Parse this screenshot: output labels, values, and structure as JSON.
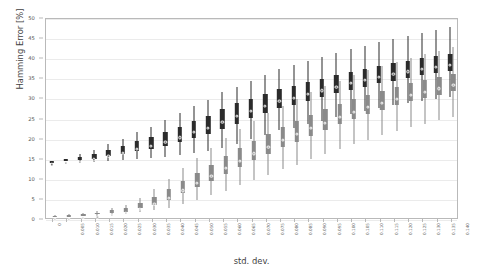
{
  "chart_data": {
    "type": "box",
    "title": "",
    "xlabel": "std. dev.",
    "ylabel": "Hamming Error [%]",
    "ylim": [
      0,
      50
    ],
    "yticks": [
      0,
      5,
      10,
      15,
      20,
      25,
      30,
      35,
      40,
      45,
      50
    ],
    "grid": true,
    "legend": "none",
    "categories": [
      "0",
      "0.005",
      "0.010",
      "0.015",
      "0.020",
      "0.025",
      "0.030",
      "0.035",
      "0.040",
      "0.045",
      "0.050",
      "0.055",
      "0.060",
      "0.065",
      "0.070",
      "0.075",
      "0.080",
      "0.085",
      "0.090",
      "0.095",
      "0.100",
      "0.105",
      "0.110",
      "0.115",
      "0.120",
      "0.125",
      "0.130",
      "0.135",
      "0.140"
    ],
    "series": [
      {
        "name": "upper",
        "color": "#2b2b2b",
        "boxes": [
          {
            "low": 14.0,
            "q1": 14.0,
            "median": 14.1,
            "q3": 14.2,
            "high": 14.3
          },
          {
            "low": 14.1,
            "q1": 14.2,
            "median": 14.4,
            "q3": 14.6,
            "high": 14.8
          },
          {
            "low": 13.8,
            "q1": 14.4,
            "median": 14.8,
            "q3": 15.2,
            "high": 15.9
          },
          {
            "low": 14.0,
            "q1": 14.8,
            "median": 15.3,
            "q3": 15.9,
            "high": 16.8
          },
          {
            "low": 14.2,
            "q1": 15.4,
            "median": 16.2,
            "q3": 17.0,
            "high": 18.3
          },
          {
            "low": 14.4,
            "q1": 16.0,
            "median": 17.0,
            "q3": 18.0,
            "high": 19.6
          },
          {
            "low": 14.6,
            "q1": 16.6,
            "median": 17.9,
            "q3": 19.1,
            "high": 21.3
          },
          {
            "low": 14.9,
            "q1": 17.2,
            "median": 18.7,
            "q3": 20.1,
            "high": 22.6
          },
          {
            "low": 15.1,
            "q1": 17.9,
            "median": 19.6,
            "q3": 21.3,
            "high": 24.3
          },
          {
            "low": 15.6,
            "q1": 18.9,
            "median": 20.8,
            "q3": 22.7,
            "high": 26.1
          },
          {
            "low": 16.2,
            "q1": 19.9,
            "median": 22.1,
            "q3": 24.2,
            "high": 27.9
          },
          {
            "low": 16.6,
            "q1": 20.9,
            "median": 23.2,
            "q3": 25.4,
            "high": 29.3
          },
          {
            "low": 17.4,
            "q1": 22.2,
            "median": 24.7,
            "q3": 27.0,
            "high": 31.4
          },
          {
            "low": 18.4,
            "q1": 23.5,
            "median": 26.1,
            "q3": 28.5,
            "high": 32.6
          },
          {
            "low": 19.6,
            "q1": 24.8,
            "median": 27.3,
            "q3": 29.6,
            "high": 34.2
          },
          {
            "low": 20.7,
            "q1": 26.1,
            "median": 28.6,
            "q3": 30.9,
            "high": 35.6
          },
          {
            "low": 21.8,
            "q1": 27.4,
            "median": 29.9,
            "q3": 32.1,
            "high": 37.0
          },
          {
            "low": 22.4,
            "q1": 28.2,
            "median": 30.7,
            "q3": 32.9,
            "high": 38.1
          },
          {
            "low": 23.3,
            "q1": 29.2,
            "median": 31.6,
            "q3": 33.8,
            "high": 39.0
          },
          {
            "low": 24.1,
            "q1": 30.1,
            "median": 32.5,
            "q3": 34.6,
            "high": 40.0
          },
          {
            "low": 25.0,
            "q1": 31.0,
            "median": 33.4,
            "q3": 35.5,
            "high": 41.0
          },
          {
            "low": 25.8,
            "q1": 31.9,
            "median": 34.3,
            "q3": 36.3,
            "high": 42.0
          },
          {
            "low": 26.6,
            "q1": 32.7,
            "median": 35.1,
            "q3": 37.1,
            "high": 42.9
          },
          {
            "low": 27.3,
            "q1": 33.5,
            "median": 35.9,
            "q3": 37.8,
            "high": 43.8
          },
          {
            "low": 28.0,
            "q1": 34.2,
            "median": 36.6,
            "q3": 38.5,
            "high": 44.6
          },
          {
            "low": 28.6,
            "q1": 34.9,
            "median": 37.2,
            "q3": 39.1,
            "high": 45.3
          },
          {
            "low": 29.2,
            "q1": 35.5,
            "median": 37.8,
            "q3": 39.7,
            "high": 46.0
          },
          {
            "low": 29.7,
            "q1": 36.0,
            "median": 38.3,
            "q3": 40.2,
            "high": 46.7
          },
          {
            "low": 30.2,
            "q1": 36.6,
            "median": 38.9,
            "q3": 40.8,
            "high": 47.6
          }
        ]
      },
      {
        "name": "lower",
        "color": "#8a8a8a",
        "boxes": [
          {
            "low": 0.3,
            "q1": 0.4,
            "median": 0.5,
            "q3": 0.6,
            "high": 0.7
          },
          {
            "low": 0.4,
            "q1": 0.5,
            "median": 0.6,
            "q3": 0.7,
            "high": 0.9
          },
          {
            "low": 0.5,
            "q1": 0.7,
            "median": 0.8,
            "q3": 1.0,
            "high": 1.2
          },
          {
            "low": 0.6,
            "q1": 0.9,
            "median": 1.1,
            "q3": 1.3,
            "high": 1.7
          },
          {
            "low": 0.8,
            "q1": 1.3,
            "median": 1.6,
            "q3": 1.9,
            "high": 2.5
          },
          {
            "low": 1.0,
            "q1": 1.6,
            "median": 2.0,
            "q3": 2.4,
            "high": 3.2
          },
          {
            "low": 1.4,
            "q1": 2.4,
            "median": 3.0,
            "q3": 3.7,
            "high": 5.0
          },
          {
            "low": 1.9,
            "q1": 3.3,
            "median": 4.2,
            "q3": 5.2,
            "high": 7.2
          },
          {
            "low": 2.6,
            "q1": 4.6,
            "median": 5.8,
            "q3": 7.1,
            "high": 9.8
          },
          {
            "low": 3.5,
            "q1": 6.1,
            "median": 7.6,
            "q3": 9.2,
            "high": 12.4
          },
          {
            "low": 4.4,
            "q1": 7.6,
            "median": 9.4,
            "q3": 11.2,
            "high": 14.9
          },
          {
            "low": 5.6,
            "q1": 9.3,
            "median": 11.3,
            "q3": 13.3,
            "high": 17.4
          },
          {
            "low": 6.8,
            "q1": 11.0,
            "median": 13.2,
            "q3": 15.4,
            "high": 19.8
          },
          {
            "low": 8.1,
            "q1": 12.7,
            "median": 15.0,
            "q3": 17.3,
            "high": 22.1
          },
          {
            "low": 9.4,
            "q1": 14.4,
            "median": 16.8,
            "q3": 19.2,
            "high": 24.2
          },
          {
            "low": 10.8,
            "q1": 16.0,
            "median": 18.5,
            "q3": 21.0,
            "high": 26.1
          },
          {
            "low": 12.1,
            "q1": 17.6,
            "median": 20.1,
            "q3": 22.6,
            "high": 27.9
          },
          {
            "low": 13.3,
            "q1": 19.0,
            "median": 21.6,
            "q3": 24.1,
            "high": 29.6
          },
          {
            "low": 14.6,
            "q1": 20.5,
            "median": 23.1,
            "q3": 25.6,
            "high": 31.3
          },
          {
            "low": 15.9,
            "q1": 21.9,
            "median": 24.5,
            "q3": 27.0,
            "high": 32.8
          },
          {
            "low": 17.1,
            "q1": 23.3,
            "median": 25.9,
            "q3": 28.3,
            "high": 34.2
          },
          {
            "low": 18.3,
            "q1": 24.6,
            "median": 27.1,
            "q3": 29.5,
            "high": 35.5
          },
          {
            "low": 19.5,
            "q1": 25.8,
            "median": 28.3,
            "q3": 30.6,
            "high": 36.7
          },
          {
            "low": 20.6,
            "q1": 26.9,
            "median": 29.4,
            "q3": 31.6,
            "high": 37.8
          },
          {
            "low": 21.6,
            "q1": 28.0,
            "median": 30.4,
            "q3": 32.6,
            "high": 38.9
          },
          {
            "low": 22.6,
            "q1": 29.0,
            "median": 31.3,
            "q3": 33.5,
            "high": 39.9
          },
          {
            "low": 23.5,
            "q1": 29.9,
            "median": 32.2,
            "q3": 34.3,
            "high": 40.8
          },
          {
            "low": 24.3,
            "q1": 30.7,
            "median": 33.0,
            "q3": 35.1,
            "high": 41.6
          },
          {
            "low": 25.1,
            "q1": 31.5,
            "median": 33.8,
            "q3": 35.9,
            "high": 42.5
          }
        ]
      }
    ]
  }
}
